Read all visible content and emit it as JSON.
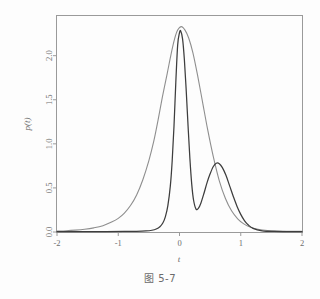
{
  "figure": {
    "caption": "图 5-7",
    "background_color": "#fdfdfd",
    "frame_color": "#9a9a9a"
  },
  "chart_data": {
    "type": "line",
    "title": "",
    "subtitle": "",
    "xlabel": "t",
    "ylabel": "p(t)",
    "xlim": [
      -2,
      2
    ],
    "ylim": [
      0.0,
      2.45
    ],
    "grid": false,
    "legend": "none",
    "xticks": [
      -2,
      -1,
      0,
      1,
      2
    ],
    "xtick_labels": [
      "-2",
      "-1",
      "0",
      "1",
      "2"
    ],
    "yticks": [
      0.0,
      0.5,
      1.0,
      1.5,
      2.0
    ],
    "ytick_labels": [
      "0.0",
      "0.5",
      "1.0",
      "1.5",
      "2.0"
    ],
    "ytick_label_rotation": -90,
    "ylabel_rotation": -90,
    "series": [
      {
        "name": "wide-unimodal",
        "color": "#8e8e8e",
        "style": "solid",
        "peak_value": 2.33,
        "peak_x": 0.03,
        "x": [
          -2.0,
          -1.85,
          -1.7,
          -1.55,
          -1.4,
          -1.25,
          -1.1,
          -1.0,
          -0.9,
          -0.8,
          -0.7,
          -0.6,
          -0.5,
          -0.42,
          -0.35,
          -0.28,
          -0.2,
          -0.14,
          -0.08,
          -0.03,
          0.03,
          0.09,
          0.15,
          0.22,
          0.3,
          0.38,
          0.46,
          0.55,
          0.65,
          0.75,
          0.85,
          0.95,
          1.05,
          1.15,
          1.3,
          1.45,
          1.6,
          1.75,
          2.0
        ],
        "y": [
          0.01,
          0.014,
          0.021,
          0.031,
          0.047,
          0.072,
          0.115,
          0.155,
          0.215,
          0.3,
          0.42,
          0.59,
          0.81,
          1.03,
          1.27,
          1.53,
          1.8,
          2.01,
          2.19,
          2.29,
          2.33,
          2.29,
          2.2,
          2.03,
          1.76,
          1.46,
          1.16,
          0.86,
          0.58,
          0.38,
          0.24,
          0.15,
          0.092,
          0.057,
          0.028,
          0.016,
          0.011,
          0.009,
          0.008
        ]
      },
      {
        "name": "narrow-bimodal",
        "color": "#3d3d3d",
        "style": "solid",
        "primary_peak_value": 2.28,
        "primary_peak_x": 0.02,
        "local_min_value": 0.26,
        "local_min_x": 0.27,
        "secondary_peak_value": 0.78,
        "secondary_peak_x": 0.6,
        "x": [
          -2.0,
          -1.6,
          -1.2,
          -0.9,
          -0.7,
          -0.55,
          -0.45,
          -0.38,
          -0.32,
          -0.27,
          -0.23,
          -0.19,
          -0.15,
          -0.12,
          -0.09,
          -0.06,
          -0.03,
          0.0,
          0.02,
          0.05,
          0.08,
          0.11,
          0.14,
          0.17,
          0.2,
          0.23,
          0.27,
          0.31,
          0.35,
          0.4,
          0.45,
          0.5,
          0.55,
          0.6,
          0.65,
          0.7,
          0.76,
          0.82,
          0.88,
          0.94,
          1.0,
          1.06,
          1.12,
          1.2,
          1.35,
          1.55,
          1.8,
          2.0
        ],
        "y": [
          0.004,
          0.004,
          0.005,
          0.006,
          0.008,
          0.012,
          0.02,
          0.034,
          0.06,
          0.105,
          0.175,
          0.3,
          0.52,
          0.8,
          1.2,
          1.7,
          2.12,
          2.26,
          2.28,
          2.19,
          1.95,
          1.6,
          1.2,
          0.83,
          0.54,
          0.36,
          0.26,
          0.27,
          0.33,
          0.44,
          0.56,
          0.66,
          0.74,
          0.78,
          0.775,
          0.73,
          0.64,
          0.52,
          0.4,
          0.29,
          0.2,
          0.13,
          0.082,
          0.042,
          0.014,
          0.006,
          0.004,
          0.004
        ]
      }
    ]
  }
}
